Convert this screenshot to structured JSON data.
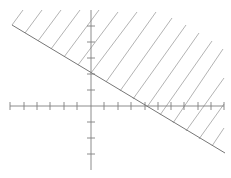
{
  "figure": {
    "inequality": "y ≥ -1/2 x + 2",
    "boundary": {
      "slope": -0.5,
      "y_intercept": 2,
      "x_intercept": 4,
      "style": "solid"
    },
    "shaded_region": "above",
    "axes": {
      "x_range": [
        -6,
        10
      ],
      "y_range": [
        -4,
        6
      ],
      "x_ticks": [
        -6,
        -5,
        -4,
        -3,
        -2,
        -1,
        1,
        2,
        3,
        4,
        5,
        6,
        7,
        8,
        9,
        10
      ],
      "y_ticks": [
        -3,
        -2,
        -1,
        1,
        2,
        3,
        4,
        5
      ],
      "labels_shown": false
    },
    "colors": {
      "line": "#7a7a7a",
      "hatch": "#9a9a9a",
      "axis": "#808080",
      "background": "#ffffff"
    }
  }
}
